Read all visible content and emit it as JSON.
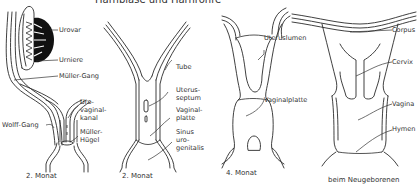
{
  "title": "Harnblase und Harnröhre",
  "panels": [
    {
      "id": "panel-1",
      "caption": "2. Monat",
      "labels": {
        "urovar": "Urovar",
        "urniere": "Urniere",
        "mueller_gang": "Müller-Gang",
        "wolff_gang": "Wolff-Gang",
        "urovaginal_1": "Uro-",
        "urovaginal_2": "vaginal-",
        "urovaginal_3": "kanal",
        "mueller_huegel_1": "Müller-",
        "mueller_huegel_2": "Hügel"
      }
    },
    {
      "id": "panel-2",
      "caption": "2. Monat",
      "labels": {
        "tube": "Tube",
        "uterusseptum_1": "Uterus-",
        "uterusseptum_2": "septum",
        "vaginalplatte_1": "Vaginal-",
        "vaginalplatte_2": "platte",
        "sinus_1": "Sinus",
        "sinus_2": "uro-",
        "sinus_3": "genitalis"
      }
    },
    {
      "id": "panel-3",
      "caption": "4. Monat",
      "labels": {
        "uteruslumen": "Uteruslumen",
        "vaginalplatte": "Vaginalplatte"
      }
    },
    {
      "id": "panel-4",
      "caption": "beim Neugeborenen",
      "labels": {
        "corpus": "Corpus",
        "cervix": "Cervix",
        "vagina": "Vagina",
        "hymen": "Hymen"
      }
    }
  ]
}
